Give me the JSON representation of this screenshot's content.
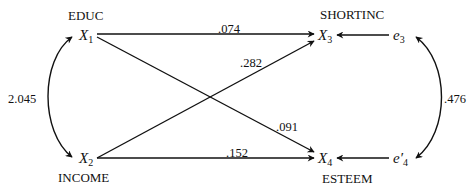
{
  "nodes": {
    "x1": {
      "name": "EDUC",
      "symbol": "X",
      "sub": "1"
    },
    "x2": {
      "name": "INCOME",
      "symbol": "X",
      "sub": "2"
    },
    "x3": {
      "name": "SHORTINC",
      "symbol": "X",
      "sub": "3"
    },
    "x4": {
      "name": "ESTEEM",
      "symbol": "X",
      "sub": "4"
    },
    "e3": {
      "symbol": "e",
      "sub": "3"
    },
    "e4": {
      "symbol": "e′",
      "sub": "4"
    }
  },
  "paths": [
    {
      "from": "X1",
      "to": "X3",
      "coefficient": ".074"
    },
    {
      "from": "X2",
      "to": "X3",
      "coefficient": ".282"
    },
    {
      "from": "X1",
      "to": "X4",
      "coefficient": ".091"
    },
    {
      "from": "X2",
      "to": "X4",
      "coefficient": ".152"
    },
    {
      "from": "e3",
      "to": "X3",
      "coefficient": ""
    },
    {
      "from": "e'4",
      "to": "X4",
      "coefficient": ""
    }
  ],
  "correlations": [
    {
      "between": [
        "X1",
        "X2"
      ],
      "value": "2.045"
    },
    {
      "between": [
        "e3",
        "e'4"
      ],
      "value": ".476"
    }
  ]
}
